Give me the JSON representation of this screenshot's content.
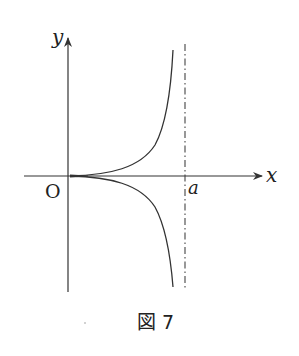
{
  "diagram": {
    "type": "function-graph",
    "x_axis_label": "x",
    "y_axis_label": "y",
    "origin_label": "O",
    "asymptote_label": "a",
    "asymptote_style": "dash-dot",
    "curves": [
      {
        "name": "upper-branch",
        "description": "increases from origin toward +infinity as x approaches a"
      },
      {
        "name": "lower-branch",
        "description": "decreases from origin toward -infinity as x approaches a"
      }
    ],
    "caption": "図 7"
  }
}
